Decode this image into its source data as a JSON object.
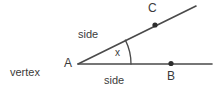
{
  "diagram": {
    "background_color": "#ffffff",
    "stroke_color": "#4a4a4a",
    "text_color": "#3b3b3b",
    "labels": {
      "vertex_point": "A",
      "ray_point_horizontal": "B",
      "ray_point_upper": "C",
      "side_upper": "side",
      "side_lower": "side",
      "angle": "x",
      "vertex_caption": "vertex"
    },
    "geometry": {
      "vertex": {
        "x": 78,
        "y": 64
      },
      "ray_horizontal_end": {
        "x": 212,
        "y": 64
      },
      "ray_upper_end": {
        "x": 196,
        "y": 6
      },
      "point_B": {
        "x": 171,
        "y": 63
      },
      "point_C": {
        "x": 155,
        "y": 25
      },
      "arc_radius": 53,
      "angle_degrees": 23
    }
  }
}
